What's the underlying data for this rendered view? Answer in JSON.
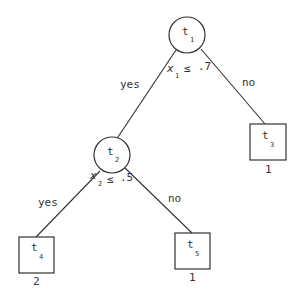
{
  "tree": {
    "nodes": [
      {
        "id": "t1",
        "label": "t",
        "sub": "1",
        "shape": "circle",
        "split": {
          "var": "x",
          "var_sub": "1",
          "op": "≤",
          "value": ".7"
        }
      },
      {
        "id": "t2",
        "label": "t",
        "sub": "2",
        "shape": "circle",
        "split": {
          "var": "x",
          "var_sub": "2",
          "op": "≤",
          "value": ".5"
        }
      },
      {
        "id": "t3",
        "label": "t",
        "sub": "3",
        "shape": "square",
        "class": "1"
      },
      {
        "id": "t4",
        "label": "t",
        "sub": "4",
        "shape": "square",
        "class": "2"
      },
      {
        "id": "t5",
        "label": "t",
        "sub": "5",
        "shape": "square",
        "class": "1"
      }
    ],
    "edges": [
      {
        "from": "t1",
        "to": "t2",
        "label": "yes"
      },
      {
        "from": "t1",
        "to": "t3",
        "label": "no"
      },
      {
        "from": "t2",
        "to": "t4",
        "label": "yes"
      },
      {
        "from": "t2",
        "to": "t5",
        "label": "no"
      }
    ]
  }
}
